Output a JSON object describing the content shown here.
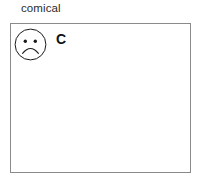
{
  "canvas": {
    "width": 199,
    "height": 181,
    "background_color": "#ffffff"
  },
  "caption": {
    "text": "comical",
    "color": "#2b2b2b"
  },
  "panel": {
    "border_color": "#8a8a8a",
    "fill_color": "#ffffff",
    "contents": {
      "icon": {
        "name": "sad-face-icon",
        "stroke_color": "#1a1a1a",
        "fill_color": "#ffffff",
        "expression": "frown"
      },
      "letter": {
        "text": "C",
        "color": "#111111"
      }
    }
  }
}
